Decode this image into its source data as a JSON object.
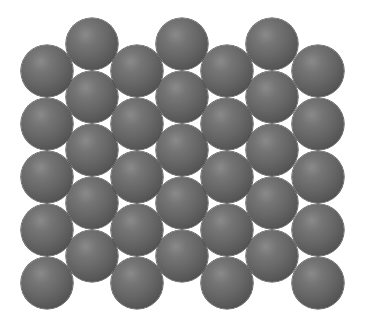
{
  "diagram": {
    "sphere": {
      "radius": 26,
      "base_color": "#666666",
      "highlight_color": "#8a8a8a",
      "edge_color": "#2e2e2e"
    },
    "layout": {
      "column_x": [
        47,
        92,
        137,
        182,
        227,
        272,
        318
      ],
      "column_start_y": [
        71,
        44,
        71,
        44,
        71,
        44,
        71
      ],
      "row_spacing": 53,
      "rows_per_column": 5
    },
    "sphere_count": 35
  }
}
